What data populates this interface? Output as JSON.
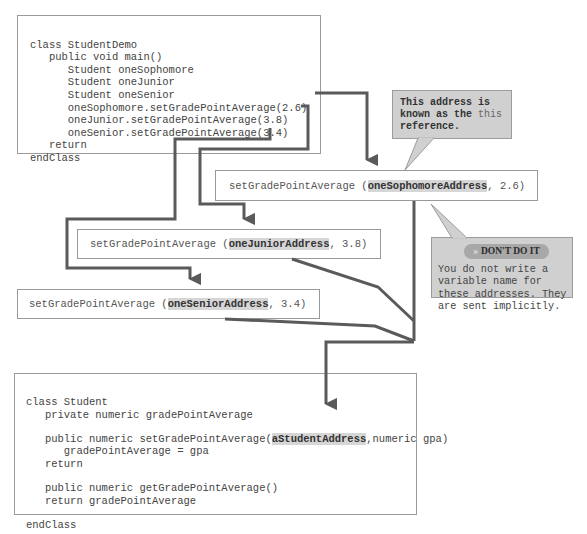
{
  "student_demo": {
    "lines": [
      "class StudentDemo",
      "   public void main()",
      "      Student oneSophomore",
      "      Student oneJunior",
      "      Student oneSenior",
      "      oneSophomore.setGradePointAverage(2.6)",
      "      oneJunior.setGradePointAverage(3.8)",
      "      oneSenior.setGradePointAverage(3.4)",
      "   return",
      "endClass"
    ]
  },
  "calls": {
    "sophomore": {
      "prefix": "setGradePointAverage (",
      "address": "oneSophomoreAddress",
      "suffix": ", 2.6)"
    },
    "junior": {
      "prefix": "setGradePointAverage (",
      "address": "oneJuniorAddress",
      "suffix": ", 3.8)"
    },
    "senior": {
      "prefix": "setGradePointAverage (",
      "address": "oneSeniorAddress",
      "suffix": ", 3.4)"
    }
  },
  "callout_this": {
    "line1": "This address is",
    "line2": "known as the ",
    "this_word": "this",
    "line3": "reference."
  },
  "callout_dont": {
    "chevron": "»",
    "title": "DON'T DO IT",
    "text": "You do not write a\nvariable name for\nthese addresses. They\nare sent implicitly."
  },
  "student_class": {
    "line1": "class Student",
    "line2": "   private numeric gradePointAverage",
    "line3_prefix": "   public numeric setGradePointAverage(",
    "line3_param": "aStudentAddress",
    "line3_suffix": ",numeric gpa)",
    "line4": "      gradePointAverage = gpa",
    "line5": "   return",
    "line6": "   public numeric getGradePointAverage()",
    "line7": "   return gradePointAverage",
    "line8": "endClass"
  },
  "colors": {
    "arrow": "#5a5a5a",
    "callout_bg": "#d0d0d0",
    "highlight": "#d6d6d6",
    "border": "#9a9a9a"
  }
}
